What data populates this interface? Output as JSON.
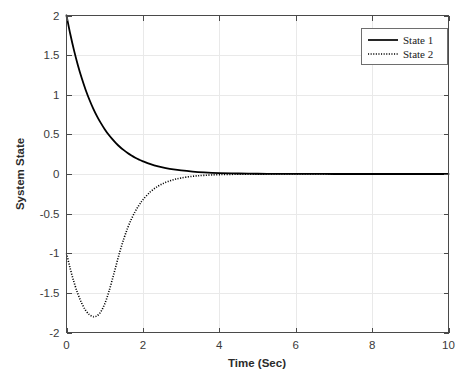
{
  "chart_data": {
    "type": "line",
    "title": "",
    "xlabel": "Time (Sec)",
    "ylabel": "System State",
    "xlim": [
      0,
      10
    ],
    "ylim": [
      -2,
      2
    ],
    "xticks": [
      0,
      2,
      4,
      6,
      8,
      10
    ],
    "yticks": [
      2,
      1.5,
      1,
      0.5,
      0,
      -0.5,
      -1,
      -1.5,
      -2
    ],
    "xtick_labels": [
      "0",
      "2",
      "4",
      "6",
      "8",
      "10"
    ],
    "ytick_labels": [
      "2",
      "1.5",
      "1",
      "0.5",
      "0",
      "-0.5",
      "-1",
      "-1.5",
      "-2"
    ],
    "grid": true,
    "legend_position": "top-right",
    "background_color": "#ffffff",
    "line_color": "#000000",
    "grid_color": "#e9e9e9",
    "axis_color": "#4a4a4a",
    "series": [
      {
        "name": "State 1",
        "style": "solid",
        "color": "#000000",
        "x": [
          0,
          0.1,
          0.2,
          0.3,
          0.4,
          0.5,
          0.6,
          0.7,
          0.8,
          0.9,
          1.0,
          1.1,
          1.2,
          1.3,
          1.4,
          1.5,
          1.6,
          1.7,
          1.8,
          1.9,
          2.0,
          2.2,
          2.4,
          2.6,
          2.8,
          3.0,
          3.3,
          3.6,
          4.0,
          4.5,
          5.0,
          5.5,
          6.0,
          6.5,
          7.0,
          7.5,
          8.0,
          8.5,
          9.0,
          9.5,
          10.0
        ],
        "values": [
          2.0,
          1.763,
          1.554,
          1.37,
          1.207,
          1.064,
          0.937,
          0.826,
          0.728,
          0.642,
          0.566,
          0.498,
          0.439,
          0.387,
          0.341,
          0.301,
          0.265,
          0.234,
          0.206,
          0.181,
          0.16,
          0.124,
          0.096,
          0.075,
          0.058,
          0.045,
          0.031,
          0.021,
          0.012,
          0.006,
          0.003,
          0.002,
          0.001,
          0.0005,
          0.0003,
          0.0001,
          0.0001,
          0.0,
          0.0,
          0.0,
          0.0
        ]
      },
      {
        "name": "State 2",
        "style": "dotted",
        "color": "#000000",
        "x": [
          0,
          0.1,
          0.2,
          0.3,
          0.4,
          0.5,
          0.6,
          0.7,
          0.72,
          0.8,
          0.9,
          1.0,
          1.1,
          1.2,
          1.3,
          1.4,
          1.5,
          1.6,
          1.7,
          1.8,
          1.9,
          2.0,
          2.2,
          2.4,
          2.6,
          2.8,
          3.0,
          3.3,
          3.6,
          4.0,
          4.5,
          5.0,
          5.5,
          6.0,
          6.5,
          7.0,
          7.5,
          8.0,
          8.5,
          9.0,
          9.5,
          10.0
        ],
        "values": [
          -1.0,
          -1.199,
          -1.371,
          -1.516,
          -1.633,
          -1.72,
          -1.776,
          -1.799,
          -1.8,
          -1.789,
          -1.737,
          -1.64,
          -1.5,
          -1.33,
          -1.15,
          -0.975,
          -0.818,
          -0.683,
          -0.568,
          -0.472,
          -0.392,
          -0.325,
          -0.223,
          -0.153,
          -0.105,
          -0.072,
          -0.05,
          -0.029,
          -0.017,
          -0.008,
          -0.003,
          -0.0014,
          -0.0006,
          -0.0003,
          -0.0001,
          -0.0001,
          0.0,
          0.0,
          0.0,
          0.0,
          0.0,
          0.0
        ]
      }
    ],
    "annotations": {
      "state1_initial": 2.0,
      "state2_initial": -1.0,
      "state2_minimum_value": -1.8,
      "state2_minimum_time": 0.72,
      "steady_state": 0.0
    }
  },
  "legend": {
    "entries": [
      {
        "label": "State 1",
        "marker": "solid-line"
      },
      {
        "label": "State 2",
        "marker": "dotted-line"
      }
    ]
  }
}
